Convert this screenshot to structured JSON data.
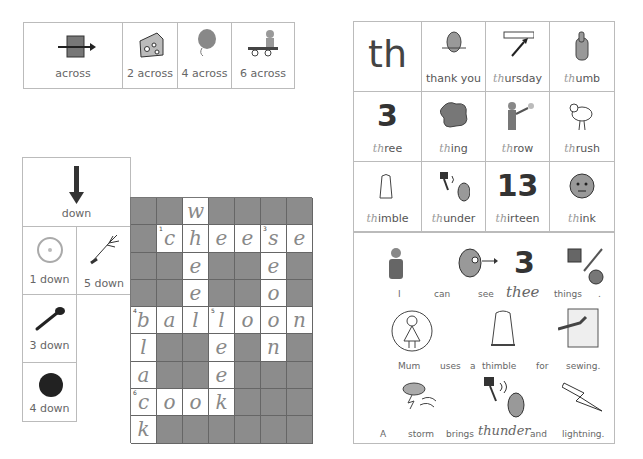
{
  "left_page": {
    "across_strip": {
      "header_label": "across",
      "header_icon": "arrow-right-through-square-icon",
      "clues": [
        {
          "label": "2 across",
          "icon": "cheese-icon"
        },
        {
          "label": "4 across",
          "icon": "balloon-icon"
        },
        {
          "label": "6 across",
          "icon": "person-cooking-icon"
        }
      ]
    },
    "down_panel": {
      "header_label": "down",
      "header_icon": "arrow-down-icon",
      "clues": [
        {
          "label": "1 down",
          "icon": "wheel-icon"
        },
        {
          "label": "5 down",
          "icon": "leek-icon"
        },
        {
          "label": "3 down",
          "icon": "spoon-icon"
        },
        {
          "label": "4 down",
          "icon": "black-dot-icon"
        }
      ]
    },
    "crossword": {
      "columns": 7,
      "rows": 9,
      "colors": {
        "blocked": "#8c8c8c",
        "open": "#ffffff",
        "lines": "#666666"
      },
      "cells": [
        [
          "#",
          "#",
          "w",
          "#",
          "#",
          "#",
          "#"
        ],
        [
          "#",
          "c",
          "h",
          "e",
          "e",
          "s",
          "e"
        ],
        [
          "#",
          "#",
          "e",
          "#",
          "#",
          "e",
          "#"
        ],
        [
          "#",
          "#",
          "e",
          "#",
          "#",
          "o",
          "#"
        ],
        [
          "b",
          "a",
          "l",
          "l",
          "o",
          "o",
          "n"
        ],
        [
          "l",
          "#",
          "#",
          "e",
          "#",
          "n",
          "#"
        ],
        [
          "a",
          "#",
          "#",
          "e",
          "#",
          "#",
          "#"
        ],
        [
          "c",
          "o",
          "o",
          "k",
          "#",
          "#",
          "#"
        ],
        [
          "k",
          "#",
          "#",
          "#",
          "#",
          "#",
          "#"
        ]
      ],
      "numbers": [
        {
          "row": 1,
          "col": 1,
          "n": "1"
        },
        {
          "row": 1,
          "col": 5,
          "n": "3"
        },
        {
          "row": 4,
          "col": 0,
          "n": "4"
        },
        {
          "row": 4,
          "col": 3,
          "n": "5"
        },
        {
          "row": 7,
          "col": 0,
          "n": "6"
        }
      ]
    }
  },
  "right_page": {
    "title_cell": "th",
    "words": [
      {
        "prefix": "",
        "text": "thank you",
        "icon": "sign-thank-you-icon"
      },
      {
        "prefix": "th",
        "text": "ursday",
        "icon": "calendar-arrow-icon"
      },
      {
        "prefix": "th",
        "text": "umb",
        "icon": "thumb-icon"
      },
      {
        "prefix": "th",
        "text": "ree",
        "icon": "number-three-icon",
        "big": "3"
      },
      {
        "prefix": "th",
        "text": "ing",
        "icon": "blob-thing-icon"
      },
      {
        "prefix": "th",
        "text": "row",
        "icon": "person-throwing-icon"
      },
      {
        "prefix": "th",
        "text": "rush",
        "icon": "bird-thrush-icon"
      },
      {
        "prefix": "th",
        "text": "imble",
        "icon": "thimble-icon"
      },
      {
        "prefix": "th",
        "text": "under",
        "icon": "thunder-icon"
      },
      {
        "prefix": "th",
        "text": "irteen",
        "icon": "number-thirteen-icon",
        "big": "13"
      },
      {
        "prefix": "th",
        "text": "ink",
        "icon": "thinking-face-icon"
      }
    ],
    "sentences": [
      {
        "words": [
          "I",
          "can",
          "see",
          "thee",
          "things",
          "."
        ],
        "big": "3"
      },
      {
        "words": [
          "Mum",
          "uses",
          "a",
          "thimble",
          "for",
          "sewing."
        ]
      },
      {
        "words": [
          "A",
          "storm",
          "brings",
          "thunder",
          "and",
          "lightning."
        ]
      }
    ]
  }
}
